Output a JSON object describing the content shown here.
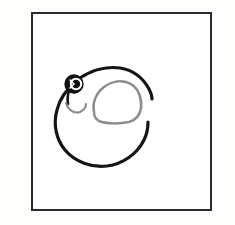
{
  "canvas": {
    "width": 235,
    "height": 225,
    "background_color": "#fdfdfc",
    "description": "Hand-drawn black ink sketch on white paper inside a thin rectangular frame"
  },
  "frame": {
    "name": "drawing-frame",
    "x": 31,
    "y": 12,
    "width": 181,
    "height": 199,
    "border_color": "#2a2a2a",
    "border_width": 2,
    "fill_color": "#ffffff"
  },
  "drawing": {
    "title": "snail-sketch",
    "subject": "snail",
    "style": "hand-drawn-line-art",
    "ink_color": "#151515",
    "shell_ink_color": "#8c8c8c",
    "strokes": [
      {
        "name": "body-outline",
        "label": "Snail body outer circle",
        "color": "#151515",
        "width": 3.1,
        "open_gap": "right side"
      },
      {
        "name": "shell-outline",
        "label": "Shell rounded dome",
        "color": "#8c8c8c",
        "width": 2.4
      },
      {
        "name": "mouth-curve",
        "label": "Small smile hook under the eye",
        "color": "#8c8c8c",
        "width": 2.0
      },
      {
        "name": "eye-disc",
        "label": "Filled black eye",
        "color": "#111111",
        "width": 2.6
      },
      {
        "name": "eye-highlight",
        "label": "White pupil ring inside eye",
        "color": "#ffffff",
        "width": 1.6
      }
    ]
  }
}
